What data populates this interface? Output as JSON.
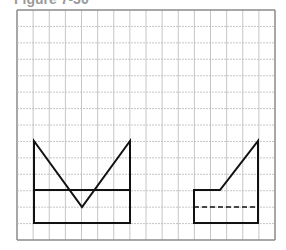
{
  "figure": {
    "title": "Figure 7-30"
  },
  "grid": {
    "left": 17,
    "top": 10,
    "cols": 16,
    "rows": 14,
    "cell_w": 16.125,
    "cell_h": 16.43,
    "line_color": "#b8b8b8",
    "border_color": "#8a8a8a"
  },
  "shapes": {
    "left_view": {
      "label": "front view",
      "stroke": "#111111",
      "outline": "M34,141 L82,207 L130,141 L130,223 L34,223 Z",
      "horizontal_line": {
        "x1": 34,
        "y1": 190,
        "x2": 130,
        "y2": 190
      }
    },
    "right_view": {
      "label": "side view",
      "stroke": "#111111",
      "outline": "M194,190 L220,190 L258,141 L258,223 L194,223 Z",
      "hidden_line": {
        "x1": 194,
        "y1": 207,
        "x2": 258,
        "y2": 207
      }
    }
  }
}
